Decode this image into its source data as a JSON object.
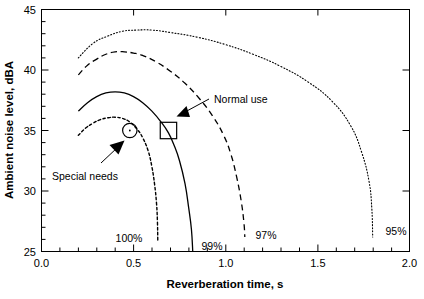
{
  "chart_data": {
    "type": "line",
    "title": "",
    "xlabel": "Reverberation time, s",
    "ylabel": "Ambient noise level, dBA",
    "xlim": [
      0.0,
      2.0
    ],
    "ylim": [
      25,
      45
    ],
    "xticks": [
      "0.0",
      "0.5",
      "1.0",
      "1.5",
      "2.0"
    ],
    "xtick_values": [
      0.0,
      0.5,
      1.0,
      1.5,
      2.0
    ],
    "yticks": [
      "25",
      "30",
      "35",
      "40",
      "45"
    ],
    "ytick_values": [
      25,
      30,
      35,
      40,
      45
    ],
    "x_minor_step": 0.1,
    "y_minor_step": 1,
    "grid": false,
    "legend_position": "inline-end-labels",
    "series": [
      {
        "name": "100%",
        "label": "100%",
        "linestyle": "dotted",
        "points": [
          [
            0.2,
            34.6
          ],
          [
            0.24,
            35.2
          ],
          [
            0.28,
            35.6
          ],
          [
            0.32,
            35.9
          ],
          [
            0.36,
            36.05
          ],
          [
            0.4,
            36.1
          ],
          [
            0.44,
            36.0
          ],
          [
            0.48,
            35.7
          ],
          [
            0.52,
            35.1
          ],
          [
            0.55,
            34.4
          ],
          [
            0.58,
            33.3
          ],
          [
            0.6,
            32.0
          ],
          [
            0.615,
            30.5
          ],
          [
            0.625,
            29.0
          ],
          [
            0.63,
            27.5
          ],
          [
            0.632,
            25.8
          ]
        ]
      },
      {
        "name": "99%",
        "label": "99%",
        "linestyle": "solid",
        "points": [
          [
            0.2,
            36.6
          ],
          [
            0.25,
            37.3
          ],
          [
            0.3,
            37.8
          ],
          [
            0.35,
            38.1
          ],
          [
            0.4,
            38.2
          ],
          [
            0.45,
            38.1
          ],
          [
            0.5,
            37.8
          ],
          [
            0.55,
            37.3
          ],
          [
            0.6,
            36.6
          ],
          [
            0.65,
            35.7
          ],
          [
            0.69,
            34.8
          ],
          [
            0.72,
            33.8
          ],
          [
            0.75,
            32.5
          ],
          [
            0.78,
            30.6
          ],
          [
            0.8,
            28.6
          ],
          [
            0.815,
            26.8
          ],
          [
            0.822,
            25.0
          ]
        ]
      },
      {
        "name": "97%",
        "label": "97%",
        "linestyle": "dashed",
        "points": [
          [
            0.2,
            39.6
          ],
          [
            0.25,
            40.4
          ],
          [
            0.3,
            40.9
          ],
          [
            0.35,
            41.3
          ],
          [
            0.4,
            41.5
          ],
          [
            0.45,
            41.5
          ],
          [
            0.5,
            41.4
          ],
          [
            0.55,
            41.2
          ],
          [
            0.62,
            40.7
          ],
          [
            0.7,
            39.9
          ],
          [
            0.78,
            38.9
          ],
          [
            0.86,
            37.6
          ],
          [
            0.93,
            36.2
          ],
          [
            0.99,
            34.6
          ],
          [
            1.03,
            33.0
          ],
          [
            1.06,
            31.2
          ],
          [
            1.085,
            29.2
          ],
          [
            1.1,
            27.4
          ],
          [
            1.105,
            26.2
          ]
        ]
      },
      {
        "name": "95%",
        "label": "95%",
        "linestyle": "dotted",
        "points": [
          [
            0.2,
            41.0
          ],
          [
            0.28,
            42.2
          ],
          [
            0.36,
            42.8
          ],
          [
            0.44,
            43.2
          ],
          [
            0.52,
            43.3
          ],
          [
            0.6,
            43.3
          ],
          [
            0.7,
            43.1
          ],
          [
            0.85,
            42.7
          ],
          [
            1.0,
            42.1
          ],
          [
            1.15,
            41.3
          ],
          [
            1.3,
            40.3
          ],
          [
            1.45,
            39.0
          ],
          [
            1.58,
            37.4
          ],
          [
            1.68,
            35.4
          ],
          [
            1.74,
            33.2
          ],
          [
            1.78,
            30.8
          ],
          [
            1.795,
            28.6
          ],
          [
            1.8,
            26.2
          ]
        ]
      }
    ],
    "markers": [
      {
        "name": "Special needs",
        "shape": "circle",
        "x": 0.48,
        "y": 35.0,
        "label": "Special needs"
      },
      {
        "name": "Normal use",
        "shape": "square",
        "x": 0.69,
        "y": 35.0,
        "label": "Normal use"
      }
    ],
    "annotations": [
      {
        "text": "Special needs",
        "points_to": "circle-marker"
      },
      {
        "text": "Normal use",
        "points_to": "square-marker"
      },
      {
        "text": "100%",
        "points_to": "100%-curve-end"
      },
      {
        "text": "99%",
        "points_to": "99%-curve-end"
      },
      {
        "text": "97%",
        "points_to": "97%-curve-end"
      },
      {
        "text": "95%",
        "points_to": "95%-curve-end"
      }
    ],
    "colors": {
      "axis": "#000000",
      "curve": "#000000",
      "background": "#ffffff"
    }
  }
}
